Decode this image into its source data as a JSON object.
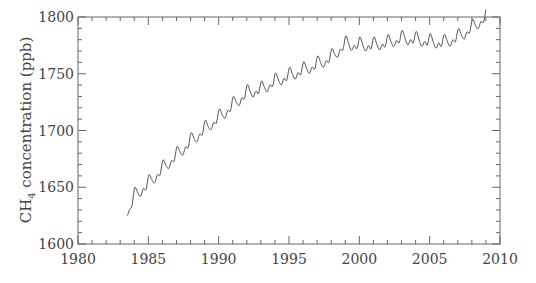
{
  "chart_data": {
    "type": "line",
    "title": "",
    "xlabel": "",
    "ylabel": "CH4 concentration (ppb)",
    "ylabel_parts": {
      "main": "CH",
      "subscript": "4",
      "rest": " concentration (ppb)"
    },
    "xlim": [
      1980,
      2010
    ],
    "ylim": [
      1600,
      1800
    ],
    "x_ticks": [
      1980,
      1985,
      1990,
      1995,
      2000,
      2005,
      2010
    ],
    "x_tick_labels": [
      "1980",
      "1985",
      "1990",
      "1995",
      "2000",
      "2005",
      "2010"
    ],
    "x_minor_step": 1,
    "y_ticks": [
      1600,
      1650,
      1700,
      1750,
      1800
    ],
    "y_tick_labels": [
      "1600",
      "1650",
      "1700",
      "1750",
      "1800"
    ],
    "y_minor_step": 10,
    "grid": false,
    "legend": null,
    "mirror_ticks": true,
    "line_color": "#555555",
    "axis_color": "#666666",
    "series": [
      {
        "name": "CH4 concentration",
        "annual_anchor": {
          "x": [
            1983.5,
            1984,
            1985,
            1986,
            1987,
            1988,
            1989,
            1990,
            1991,
            1992,
            1993,
            1994,
            1995,
            1996,
            1997,
            1998,
            1999,
            2000,
            2001,
            2002,
            2003,
            2004,
            2005,
            2006,
            2007,
            2008,
            2009
          ],
          "y": [
            1625,
            1642,
            1653,
            1666,
            1678,
            1690,
            1701,
            1711,
            1722,
            1733,
            1736,
            1743,
            1748,
            1753,
            1758,
            1764,
            1776,
            1775,
            1775,
            1777,
            1781,
            1780,
            1778,
            1777,
            1782,
            1790,
            1800
          ]
        },
        "seasonal_amplitude_ppb": 8
      }
    ]
  }
}
